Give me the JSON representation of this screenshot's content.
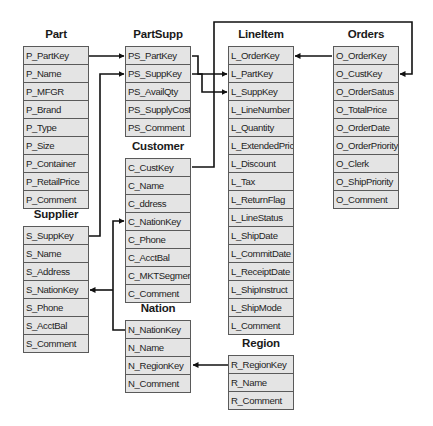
{
  "tables": {
    "part": {
      "title": "Part",
      "columns": [
        "P_PartKey",
        "P_Name",
        "P_MFGR",
        "P_Brand",
        "P_Type",
        "P_Size",
        "P_Container",
        "P_RetailPrice",
        "P_Comment"
      ]
    },
    "partsupp": {
      "title": "PartSupp",
      "columns": [
        "PS_PartKey",
        "PS_SuppKey",
        "PS_AvailQty",
        "PS_SupplyCost",
        "PS_Comment"
      ]
    },
    "customer": {
      "title": "Customer",
      "columns": [
        "C_CustKey",
        "C_Name",
        "C_ddress",
        "C_NationKey",
        "C_Phone",
        "C_AcctBal",
        "C_MKTSegment",
        "C_Comment"
      ]
    },
    "supplier": {
      "title": "Supplier",
      "columns": [
        "S_SuppKey",
        "S_Name",
        "S_Address",
        "S_NationKey",
        "S_Phone",
        "S_AcctBal",
        "S_Comment"
      ]
    },
    "nation": {
      "title": "Nation",
      "columns": [
        "N_NationKey",
        "N_Name",
        "N_RegionKey",
        "N_Comment"
      ]
    },
    "lineitem": {
      "title": "LineItem",
      "columns": [
        "L_OrderKey",
        "L_PartKey",
        "L_SuppKey",
        "L_LineNumber",
        "L_Quantity",
        "L_ExtendedPrice",
        "L_Discount",
        "L_Tax",
        "L_ReturnFlag",
        "L_LineStatus",
        "L_ShipDate",
        "L_CommitDate",
        "L_ReceiptDate",
        "L_ShipInstruct",
        "L_ShipMode",
        "L_Comment"
      ]
    },
    "orders": {
      "title": "Orders",
      "columns": [
        "O_OrderKey",
        "O_CustKey",
        "O_OrderSatus",
        "O_TotalPrice",
        "O_OrderDate",
        "O_OrderPriority",
        "O_Clerk",
        "O_ShipPriority",
        "O_Comment"
      ]
    },
    "region": {
      "title": "Region",
      "columns": [
        "R_RegionKey",
        "R_Name",
        "R_Comment"
      ]
    }
  },
  "relationships": [
    {
      "from": "P_PartKey",
      "to": "PS_PartKey"
    },
    {
      "from": "S_SuppKey",
      "to": "PS_SuppKey"
    },
    {
      "from": "PS_PartKey",
      "to": "L_PartKey"
    },
    {
      "from": "PS_SuppKey",
      "to": "L_SuppKey"
    },
    {
      "from": "O_OrderKey",
      "to": "L_OrderKey"
    },
    {
      "from": "C_CustKey",
      "to": "O_CustKey"
    },
    {
      "from": "N_NationKey",
      "to": "C_NationKey"
    },
    {
      "from": "N_NationKey",
      "to": "S_NationKey"
    },
    {
      "from": "R_RegionKey",
      "to": "N_RegionKey"
    }
  ],
  "colors": {
    "cell_bg": "#e4e4e4",
    "border": "#5a5a5a",
    "line": "#111111"
  }
}
